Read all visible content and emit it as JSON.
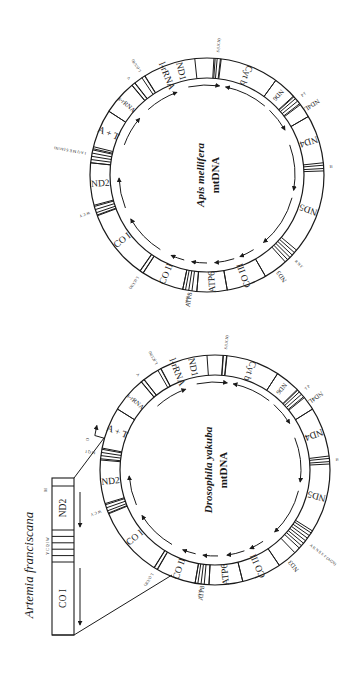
{
  "figure": {
    "orientation_deg": 90,
    "ink": "#1a1a1a",
    "background": "#ffffff"
  },
  "genomes": [
    {
      "id": "apis",
      "title": "Apis mellifera",
      "subtitle": "mtDNA",
      "center": [
        207,
        175
      ],
      "r_outer": 117,
      "r_inner": 97,
      "genes": [
        {
          "name": "ND1",
          "start": -32,
          "end": 4,
          "small": false
        },
        {
          "name": "Cyt b",
          "start": 7,
          "end": 36,
          "small": false
        },
        {
          "name": "ND6",
          "start": 36,
          "end": 48,
          "small": true
        },
        {
          "name": "ND4L",
          "start": 53,
          "end": 60,
          "small": true,
          "outside": true
        },
        {
          "name": "ND4",
          "start": 60,
          "end": 84,
          "small": false
        },
        {
          "name": "ND5",
          "start": 88,
          "end": 130,
          "small": false
        },
        {
          "name": "ND3",
          "start": 138,
          "end": 150,
          "small": true,
          "outside": true
        },
        {
          "name": "CO III",
          "start": 150,
          "end": 170,
          "small": false
        },
        {
          "name": "ATP6",
          "start": 170,
          "end": 185,
          "small": false
        },
        {
          "name": "ATP8",
          "start": 185,
          "end": 192,
          "small": true,
          "outside": true
        },
        {
          "name": "CO II",
          "start": 192,
          "end": 213,
          "small": false
        },
        {
          "name": "CO I",
          "start": 215,
          "end": 250,
          "small": false
        },
        {
          "name": "ND2",
          "start": 255,
          "end": 276,
          "small": false
        },
        {
          "name": "A + T",
          "start": 283,
          "end": 303,
          "small": false
        },
        {
          "name": "s-rRNA",
          "start": 303,
          "end": 320,
          "small": true
        },
        {
          "name": "l-rRNA",
          "start": 322,
          "end": 354,
          "small": false
        }
      ],
      "trna_groups": [
        {
          "angle": -33,
          "lines": 2,
          "label": "L (UUR)"
        },
        {
          "angle": 5,
          "lines": 3,
          "label": "S (UCN)"
        },
        {
          "angle": 50,
          "lines": 4,
          "label": "P T"
        },
        {
          "angle": 86,
          "lines": 2,
          "label": "H"
        },
        {
          "angle": 134,
          "lines": 4,
          "label": "R N F"
        },
        {
          "angle": 189,
          "lines": 3,
          "label": "D K"
        },
        {
          "angle": 214,
          "lines": 2,
          "label": "L (CUN)"
        },
        {
          "angle": 252,
          "lines": 4,
          "label": "W C Y"
        },
        {
          "angle": 280,
          "lines": 6,
          "label": "I A Q M E S (AGN)"
        },
        {
          "angle": 321,
          "lines": 2,
          "label": "V"
        }
      ],
      "arrows": [
        {
          "from": 318,
          "to": 340,
          "r": 88
        },
        {
          "from": 348,
          "to": 8,
          "r": 90
        },
        {
          "from": 40,
          "to": 12,
          "r": 90
        },
        {
          "from": 44,
          "to": 60,
          "r": 90
        },
        {
          "from": 70,
          "to": 100,
          "r": 88
        },
        {
          "from": 105,
          "to": 140,
          "r": 88
        },
        {
          "from": 148,
          "to": 158,
          "r": 88
        },
        {
          "from": 162,
          "to": 175,
          "r": 88
        },
        {
          "from": 180,
          "to": 190,
          "r": 88
        },
        {
          "from": 195,
          "to": 204,
          "r": 88
        },
        {
          "from": 212,
          "to": 240,
          "r": 88
        },
        {
          "from": 248,
          "to": 268,
          "r": 88
        },
        {
          "from": 290,
          "to": 310,
          "r": 88
        }
      ]
    },
    {
      "id": "drosophila",
      "title": "Drosophila yakuba",
      "subtitle": "mtDNA",
      "center": [
        215,
        470
      ],
      "r_outer": 115,
      "r_inner": 95,
      "genes": [
        {
          "name": "ND1",
          "start": -28,
          "end": 4,
          "small": false
        },
        {
          "name": "Cyt b",
          "start": 6,
          "end": 33,
          "small": false
        },
        {
          "name": "ND6",
          "start": 33,
          "end": 46,
          "small": true
        },
        {
          "name": "ND4L",
          "start": 51,
          "end": 58,
          "small": true,
          "outside": true
        },
        {
          "name": "ND4",
          "start": 58,
          "end": 83,
          "small": false
        },
        {
          "name": "ND5",
          "start": 87,
          "end": 122,
          "small": false
        },
        {
          "name": "ND3",
          "start": 136,
          "end": 146,
          "small": true,
          "outside": true
        },
        {
          "name": "CO III",
          "start": 146,
          "end": 166,
          "small": false
        },
        {
          "name": "ATP6",
          "start": 166,
          "end": 183,
          "small": false
        },
        {
          "name": "ATP8",
          "start": 183,
          "end": 190,
          "small": true,
          "outside": true
        },
        {
          "name": "CO II",
          "start": 190,
          "end": 210,
          "small": false
        },
        {
          "name": "CO I",
          "start": 212,
          "end": 248,
          "small": false
        },
        {
          "name": "ND2",
          "start": 253,
          "end": 275,
          "small": false
        },
        {
          "name": "A + T",
          "start": 281,
          "end": 302,
          "small": false
        },
        {
          "name": "s-rRNA",
          "start": 302,
          "end": 320,
          "small": true
        },
        {
          "name": "l-rRNA",
          "start": 322,
          "end": 356,
          "small": false
        }
      ],
      "trna_groups": [
        {
          "angle": -29,
          "lines": 2,
          "label": "L (CUN)"
        },
        {
          "angle": 5,
          "lines": 2,
          "label": "S (UCN)"
        },
        {
          "angle": 48,
          "lines": 4,
          "label": "T P"
        },
        {
          "angle": 85,
          "lines": 2,
          "label": "H"
        },
        {
          "angle": 128,
          "lines": 7,
          "label": "A R N S E F (AGN)"
        },
        {
          "angle": 187,
          "lines": 3,
          "label": "K D"
        },
        {
          "angle": 211,
          "lines": 2,
          "label": "L (UUR)"
        },
        {
          "angle": 250,
          "lines": 4,
          "label": "W C Y"
        },
        {
          "angle": 278,
          "lines": 4,
          "label": "M Q I"
        },
        {
          "angle": 321,
          "lines": 2,
          "label": "V"
        }
      ],
      "arrows": [
        {
          "from": 318,
          "to": 340,
          "r": 86
        },
        {
          "from": 348,
          "to": 8,
          "r": 88
        },
        {
          "from": 38,
          "to": 12,
          "r": 88
        },
        {
          "from": 42,
          "to": 58,
          "r": 88
        },
        {
          "from": 68,
          "to": 98,
          "r": 86
        },
        {
          "from": 104,
          "to": 136,
          "r": 86
        },
        {
          "from": 146,
          "to": 156,
          "r": 86
        },
        {
          "from": 160,
          "to": 172,
          "r": 86
        },
        {
          "from": 178,
          "to": 188,
          "r": 86
        },
        {
          "from": 193,
          "to": 202,
          "r": 86
        },
        {
          "from": 210,
          "to": 238,
          "r": 86
        },
        {
          "from": 246,
          "to": 266,
          "r": 86
        }
      ],
      "origin_marker": {
        "angle": 286,
        "label": "O"
      }
    }
  ],
  "artemia": {
    "title": "Artemia franciscana",
    "box": {
      "x": 52,
      "y": 478,
      "w": 22,
      "h": 157
    },
    "segments": [
      {
        "name": "",
        "y0": 478,
        "y1": 486
      },
      {
        "name": "ND2",
        "y0": 486,
        "y1": 530
      },
      {
        "name": "tRNAs",
        "y0": 530,
        "y1": 562,
        "stripes": 5
      },
      {
        "name": "CO I",
        "y0": 562,
        "y1": 635
      }
    ],
    "labels": {
      "top": "M",
      "trna": "Y C Q I W"
    },
    "arrows": [
      {
        "x": 80,
        "y0": 492,
        "y1": 527
      },
      {
        "x": 80,
        "y0": 568,
        "y1": 625
      }
    ],
    "connector": {
      "from_top": [
        74,
        478
      ],
      "to_top": [
        104,
        438
      ],
      "from_bottom": [
        74,
        635
      ],
      "to_bottom": [
        172,
        575
      ]
    }
  }
}
